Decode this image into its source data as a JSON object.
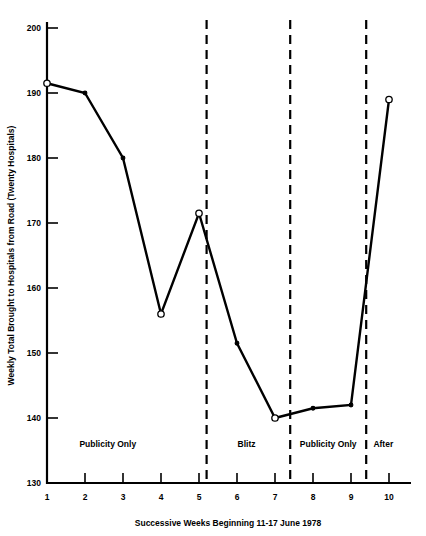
{
  "chart_data": {
    "type": "line",
    "title": "",
    "xlabel": "Successive Weeks Beginning 11-17 June 1978",
    "ylabel": "Weekly Total Brought to Hospitals from Road (Twenty Hospitals)",
    "x": [
      1,
      2,
      3,
      4,
      5,
      6,
      7,
      8,
      9,
      10
    ],
    "values": [
      191.5,
      190.0,
      180.0,
      156.0,
      171.5,
      151.5,
      140.0,
      141.5,
      142.0,
      189.0
    ],
    "xtick_labels": [
      "1",
      "2",
      "3",
      "4",
      "5",
      "6",
      "7",
      "8",
      "9",
      "10"
    ],
    "ytick_labels": [
      "130",
      "140",
      "150",
      "160",
      "170",
      "180",
      "190",
      "200"
    ],
    "yticks": [
      130,
      140,
      150,
      160,
      170,
      180,
      190,
      200
    ],
    "xlim": [
      1,
      10
    ],
    "ylim": [
      130,
      200
    ],
    "grid": false,
    "legend": "none",
    "marker_styles": [
      "open",
      "filled",
      "filled",
      "open",
      "open",
      "filled",
      "open",
      "filled",
      "filled",
      "open"
    ],
    "line_color": "#000000",
    "background_color": "#ffffff",
    "dividers": [
      {
        "x": 5.2,
        "label": "period-divider-1"
      },
      {
        "x": 7.4,
        "label": "period-divider-2"
      },
      {
        "x": 9.4,
        "label": "period-divider-3"
      }
    ],
    "annotations": [
      {
        "text": "Publicity Only",
        "x": 2.6,
        "y": 135.5
      },
      {
        "text": "Blitz",
        "x": 6.25,
        "y": 135.5
      },
      {
        "text": "Publicity Only",
        "x": 8.4,
        "y": 135.5
      },
      {
        "text": "After",
        "x": 9.85,
        "y": 135.5
      }
    ]
  }
}
